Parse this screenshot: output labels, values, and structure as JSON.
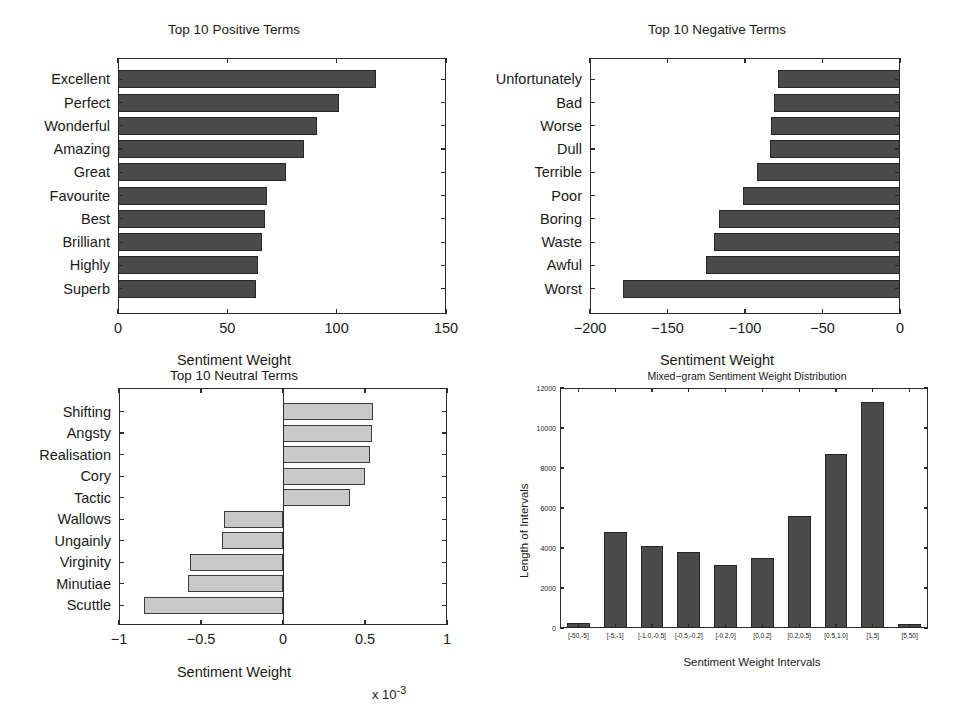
{
  "figure": {
    "panels": [
      "positive",
      "negative",
      "neutral",
      "distribution"
    ]
  },
  "chart_data": [
    {
      "type": "bar",
      "orientation": "horizontal",
      "id": "positive",
      "title": "Top 10 Positive Terms",
      "xlabel": "Sentiment Weight",
      "ylabel": "",
      "xlim": [
        0,
        150
      ],
      "xticks": [
        "0",
        "50",
        "100",
        "150"
      ],
      "xtickvalues": [
        0,
        50,
        100,
        150
      ],
      "grid": false,
      "categories": [
        "Excellent",
        "Perfect",
        "Wonderful",
        "Amazing",
        "Great",
        "Favourite",
        "Best",
        "Brilliant",
        "Highly",
        "Superb"
      ],
      "values": [
        118,
        101,
        91,
        85,
        77,
        68,
        67,
        66,
        64,
        63
      ],
      "bar_color": "#4a4a4a",
      "edge_color": "#262626"
    },
    {
      "type": "bar",
      "orientation": "horizontal",
      "id": "negative",
      "title": "Top 10 Negative Terms",
      "xlabel": "Sentiment Weight",
      "ylabel": "",
      "xlim": [
        -200,
        0
      ],
      "xticks": [
        "−200",
        "−150",
        "−100",
        "−50",
        "0"
      ],
      "xtickvalues": [
        -200,
        -150,
        -100,
        -50,
        0
      ],
      "grid": false,
      "categories": [
        "Unfortunately",
        "Bad",
        "Worse",
        "Dull",
        "Terrible",
        "Poor",
        "Boring",
        "Waste",
        "Awful",
        "Worst"
      ],
      "values": [
        -79,
        -81,
        -83,
        -84,
        -92,
        -101,
        -117,
        -120,
        -125,
        -179
      ],
      "bar_color": "#4a4a4a",
      "edge_color": "#262626"
    },
    {
      "type": "bar",
      "orientation": "horizontal",
      "id": "neutral",
      "title": "Top 10 Neutral Terms",
      "xlabel": "Sentiment Weight",
      "ylabel": "",
      "exponent_label": "x 10",
      "exponent_value": "-3",
      "xlim": [
        -1,
        1
      ],
      "xticks": [
        "−1",
        "−0.5",
        "0",
        "0.5",
        "1"
      ],
      "xtickvalues": [
        -1,
        -0.5,
        0,
        0.5,
        1
      ],
      "grid": false,
      "categories": [
        "Shifting",
        "Angsty",
        "Realisation",
        "Cory",
        "Tactic",
        "Wallows",
        "Ungainly",
        "Virginity",
        "Minutiae",
        "Scuttle"
      ],
      "values": [
        0.55,
        0.54,
        0.53,
        0.5,
        0.41,
        -0.36,
        -0.37,
        -0.57,
        -0.58,
        -0.85
      ],
      "value_scale": "1e-3",
      "bar_color": "#c9c9c9",
      "edge_color": "#3a3a3a"
    },
    {
      "type": "bar",
      "orientation": "vertical",
      "id": "distribution",
      "title": "Mixed−gram Sentiment Weight Distribution",
      "xlabel": "Sentiment Weight Intervals",
      "ylabel": "Length of Intervals",
      "ylim": [
        0,
        12000
      ],
      "yticks": [
        "0",
        "2000",
        "4000",
        "6000",
        "8000",
        "10000",
        "12000"
      ],
      "ytickvalues": [
        0,
        2000,
        4000,
        6000,
        8000,
        10000,
        12000
      ],
      "grid": false,
      "categories": [
        "[-50,-5]",
        "[-5,-1]",
        "[-1.0,-0.5]",
        "[-0.5,-0.2]",
        "[-0.2,0]",
        "[0,0.2]",
        "[0.2,0.5]",
        "[0.5,1.0]",
        "[1,5]",
        "[5,50]"
      ],
      "values": [
        250,
        4780,
        4100,
        3780,
        3150,
        3500,
        5620,
        8700,
        11300,
        180
      ],
      "bar_color": "#4a4a4a",
      "edge_color": "#262626"
    }
  ]
}
